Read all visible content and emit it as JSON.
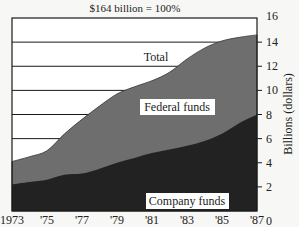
{
  "chart_data": {
    "type": "area",
    "title": "$164 billion = 100%",
    "xlabel": "",
    "ylabel": "Billions (dollars)",
    "ylim": [
      0,
      16
    ],
    "xlim": [
      1973,
      1987
    ],
    "grid": true,
    "x": [
      1973,
      1974,
      1975,
      1976,
      1977,
      1978,
      1979,
      1980,
      1981,
      1982,
      1983,
      1984,
      1985,
      1986,
      1987
    ],
    "x_tick_labels": [
      "1973",
      "'75",
      "'77",
      "'79",
      "'81",
      "'83",
      "'85",
      "'87"
    ],
    "x_ticks": [
      1973,
      1975,
      1977,
      1979,
      1981,
      1983,
      1985,
      1987
    ],
    "y_ticks": [
      0,
      2,
      4,
      6,
      8,
      10,
      12,
      14,
      16
    ],
    "series": [
      {
        "name": "Total",
        "values": [
          4.1,
          4.5,
          5.0,
          6.4,
          7.6,
          8.7,
          9.7,
          10.3,
          10.8,
          11.5,
          12.6,
          13.5,
          14.1,
          14.4,
          14.6
        ]
      },
      {
        "name": "Federal funds",
        "values": [
          1.9,
          2.1,
          2.4,
          3.4,
          4.5,
          5.2,
          5.7,
          5.9,
          6.0,
          6.4,
          7.2,
          7.7,
          7.7,
          7.1,
          6.6
        ]
      },
      {
        "name": "Company funds",
        "values": [
          2.2,
          2.4,
          2.6,
          3.0,
          3.1,
          3.5,
          4.0,
          4.4,
          4.8,
          5.1,
          5.4,
          5.8,
          6.4,
          7.3,
          8.0
        ]
      }
    ],
    "annotations": [
      "Total",
      "Federal funds",
      "Company funds"
    ],
    "colors": {
      "total_bg": "#ffffff",
      "federal": "#6e6e6e",
      "company": "#222222",
      "frame": "#1a1a1a"
    }
  }
}
